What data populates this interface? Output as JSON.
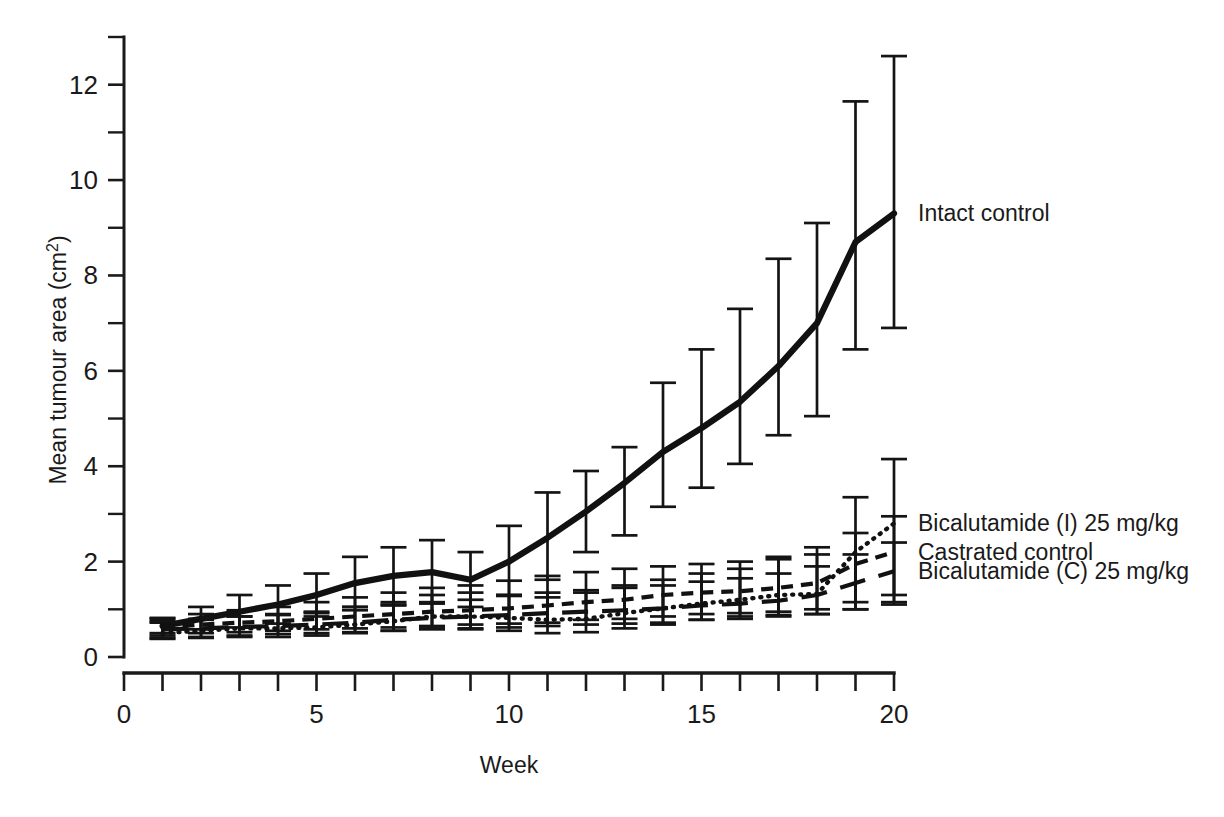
{
  "chart_data": {
    "type": "line",
    "title": "",
    "xlabel": "Week",
    "ylabel": "Mean tumour area (cm2)",
    "ylabel_base": "Mean tumour area (cm",
    "ylabel_sup": "2",
    "ylabel_close": ")",
    "xlim": [
      0,
      20
    ],
    "ylim": [
      0,
      13
    ],
    "grid": false,
    "legend_position": "right-inline-labels",
    "x_ticks_major": [
      0,
      5,
      10,
      15,
      20
    ],
    "x_ticks_minor": [
      1,
      2,
      3,
      4,
      6,
      7,
      8,
      9,
      11,
      12,
      13,
      14,
      16,
      17,
      18,
      19
    ],
    "x_ticklabels": [
      "0",
      "5",
      "10",
      "15",
      "20"
    ],
    "y_ticks_major": [
      0,
      2,
      4,
      6,
      8,
      10,
      12
    ],
    "y_ticks_minor": [
      1,
      3,
      5,
      7,
      9,
      11,
      13
    ],
    "y_ticklabels": [
      "0",
      "2",
      "4",
      "6",
      "8",
      "10",
      "12"
    ],
    "x": [
      1,
      2,
      3,
      4,
      5,
      6,
      7,
      8,
      9,
      10,
      11,
      12,
      13,
      14,
      15,
      16,
      17,
      18,
      19,
      20
    ],
    "series": [
      {
        "name": "Intact control",
        "style": "solid",
        "label_x": 20,
        "label_y": 9.3,
        "values": [
          0.65,
          0.8,
          0.95,
          1.1,
          1.3,
          1.55,
          1.7,
          1.78,
          1.62,
          2.0,
          2.5,
          3.05,
          3.65,
          4.3,
          4.8,
          5.35,
          6.1,
          7.0,
          8.7,
          9.3
        ],
        "err_low": [
          0.5,
          0.58,
          0.62,
          0.7,
          0.85,
          1.05,
          1.1,
          1.12,
          1.05,
          1.3,
          1.62,
          2.2,
          2.55,
          3.15,
          3.55,
          4.05,
          4.65,
          5.05,
          6.45,
          6.9
        ],
        "err_high": [
          0.82,
          1.05,
          1.3,
          1.5,
          1.75,
          2.1,
          2.3,
          2.45,
          2.2,
          2.75,
          3.45,
          3.9,
          4.4,
          5.75,
          6.45,
          7.3,
          8.35,
          9.1,
          11.65,
          12.6
        ]
      },
      {
        "name": "Bicalutamide (I) 25 mg/kg",
        "style": "dotted",
        "label_x": 20,
        "label_y": 2.8,
        "values": [
          0.5,
          0.55,
          0.6,
          0.6,
          0.62,
          0.68,
          0.75,
          0.85,
          0.85,
          0.82,
          0.78,
          0.8,
          0.92,
          1.02,
          1.12,
          1.2,
          1.3,
          1.32,
          2.2,
          2.8
        ],
        "err_low": [
          0.38,
          0.4,
          0.42,
          0.42,
          0.45,
          0.5,
          0.55,
          0.6,
          0.58,
          0.55,
          0.5,
          0.52,
          0.6,
          0.68,
          0.78,
          0.85,
          0.88,
          0.9,
          1.0,
          1.1
        ],
        "err_high": [
          0.72,
          0.78,
          0.85,
          0.9,
          0.95,
          1.05,
          1.15,
          1.3,
          1.35,
          1.3,
          1.25,
          1.35,
          1.5,
          1.62,
          1.75,
          1.85,
          2.05,
          2.15,
          3.35,
          4.15
        ]
      },
      {
        "name": "Castrated control",
        "style": "dashed",
        "label_x": 20,
        "label_y": 2.2,
        "values": [
          0.62,
          0.68,
          0.72,
          0.75,
          0.8,
          0.85,
          0.9,
          0.95,
          0.98,
          1.02,
          1.08,
          1.15,
          1.2,
          1.3,
          1.35,
          1.38,
          1.45,
          1.55,
          1.95,
          2.2
        ],
        "err_low": [
          0.45,
          0.5,
          0.52,
          0.55,
          0.58,
          0.6,
          0.62,
          0.65,
          0.68,
          0.7,
          0.72,
          0.78,
          0.8,
          0.85,
          0.9,
          0.92,
          0.95,
          1.0,
          1.15,
          1.3
        ],
        "err_high": [
          0.8,
          0.9,
          0.98,
          1.05,
          1.15,
          1.25,
          1.35,
          1.45,
          1.5,
          1.6,
          1.7,
          1.78,
          1.85,
          1.9,
          1.95,
          2.0,
          2.1,
          2.3,
          2.6,
          2.95
        ]
      },
      {
        "name": "Bicalutamide (C) 25 mg/kg",
        "style": "longdash",
        "label_x": 20,
        "label_y": 1.8,
        "values": [
          0.58,
          0.6,
          0.63,
          0.65,
          0.68,
          0.72,
          0.78,
          0.82,
          0.85,
          0.88,
          0.92,
          0.95,
          0.98,
          1.02,
          1.08,
          1.12,
          1.18,
          1.3,
          1.55,
          1.8
        ],
        "err_low": [
          0.4,
          0.42,
          0.45,
          0.48,
          0.5,
          0.52,
          0.55,
          0.58,
          0.6,
          0.62,
          0.65,
          0.68,
          0.7,
          0.72,
          0.78,
          0.8,
          0.85,
          0.9,
          1.0,
          1.15
        ],
        "err_high": [
          0.75,
          0.8,
          0.85,
          0.88,
          0.92,
          0.98,
          1.08,
          1.15,
          1.2,
          1.28,
          1.35,
          1.4,
          1.45,
          1.5,
          1.58,
          1.65,
          1.75,
          1.9,
          2.15,
          2.4
        ]
      }
    ]
  },
  "labels": {
    "intact_control": "Intact control",
    "bicalutamide_i": "Bicalutamide (I) 25 mg/kg",
    "castrated_control": "Castrated control",
    "bicalutamide_c": "Bicalutamide (C) 25 mg/kg"
  },
  "colors": {
    "ink": "#1a1a1a",
    "background": "#ffffff"
  }
}
